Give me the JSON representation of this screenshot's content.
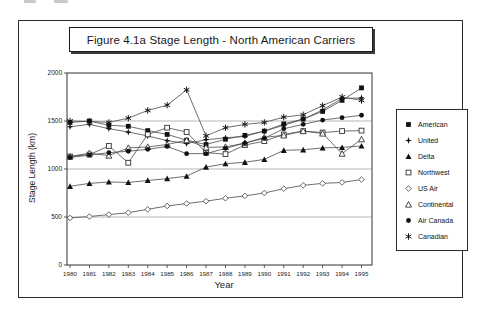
{
  "page": {
    "artifacts": "cropped-print-marks-top-edge"
  },
  "figure": {
    "title": "Figure 4.1a  Stage Length - North American Carriers"
  },
  "chart_data": {
    "type": "line",
    "title": "Figure 4.1a  Stage Length - North American Carriers",
    "xlabel": "Year",
    "ylabel": "Stage Length (km)",
    "ylim": [
      0,
      2000
    ],
    "yticks": [
      0,
      500,
      1000,
      1500,
      2000
    ],
    "gridlines": [
      500,
      1000,
      1500
    ],
    "grid": "horizontal-only",
    "legend_position": "right-outside",
    "x": [
      1980,
      1981,
      1982,
      1983,
      1984,
      1985,
      1986,
      1987,
      1988,
      1989,
      1990,
      1991,
      1992,
      1993,
      1994,
      1995
    ],
    "series": [
      {
        "name": "American",
        "marker": "filled-square",
        "values": [
          1485,
          1500,
          1455,
          1445,
          1400,
          1360,
          1300,
          1255,
          1310,
          1350,
          1395,
          1470,
          1520,
          1600,
          1715,
          1845
        ]
      },
      {
        "name": "United",
        "marker": "filled-four-point-star",
        "values": [
          1440,
          1465,
          1420,
          1385,
          1345,
          1295,
          1265,
          1305,
          1325,
          1340,
          1395,
          1455,
          1520,
          1615,
          1735,
          1740
        ]
      },
      {
        "name": "Delta",
        "marker": "filled-triangle",
        "values": [
          820,
          850,
          865,
          860,
          880,
          900,
          925,
          1020,
          1055,
          1070,
          1100,
          1195,
          1200,
          1220,
          1225,
          1240
        ]
      },
      {
        "name": "Northwest",
        "marker": "open-square",
        "values": [
          1130,
          1150,
          1240,
          1065,
          1360,
          1430,
          1385,
          1170,
          1155,
          1250,
          1290,
          1360,
          1395,
          1380,
          1395,
          1400
        ]
      },
      {
        "name": "US Air",
        "marker": "open-diamond",
        "values": [
          490,
          505,
          525,
          545,
          580,
          615,
          640,
          665,
          695,
          720,
          750,
          795,
          830,
          850,
          860,
          890
        ]
      },
      {
        "name": "Continental",
        "marker": "open-triangle",
        "values": [
          1130,
          1165,
          1140,
          1220,
          1230,
          1255,
          1300,
          1225,
          1230,
          1270,
          1330,
          1350,
          1395,
          1370,
          1160,
          1310
        ]
      },
      {
        "name": "Air Canada",
        "marker": "filled-circle",
        "values": [
          1120,
          1145,
          1170,
          1185,
          1205,
          1235,
          1160,
          1160,
          1215,
          1270,
          1320,
          1420,
          1465,
          1510,
          1535,
          1560
        ]
      },
      {
        "name": "Canadian",
        "marker": "six-point-star",
        "values": [
          1500,
          1495,
          1485,
          1530,
          1610,
          1665,
          1825,
          1345,
          1430,
          1465,
          1485,
          1540,
          1565,
          1660,
          1750,
          1715
        ]
      }
    ]
  }
}
